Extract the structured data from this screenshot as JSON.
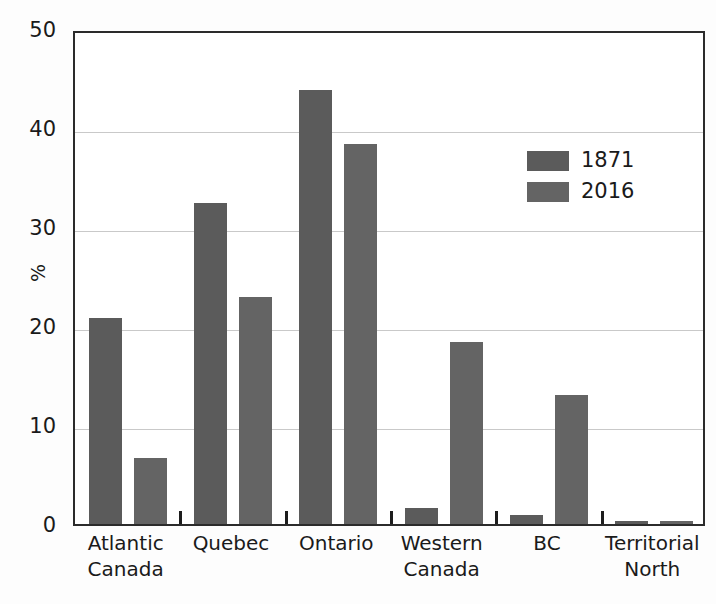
{
  "chart_data": {
    "type": "bar",
    "title": "",
    "subtitle": "",
    "xlabel": "",
    "ylabel": "%",
    "ylim": [
      0,
      50
    ],
    "yticks": [
      0,
      10,
      20,
      30,
      40,
      50
    ],
    "ytick_labels": [
      "0",
      "10",
      "20",
      "30",
      "40",
      "50"
    ],
    "grid": "horizontal",
    "legend_position": "top-right-inside",
    "categories": [
      "Atlantic Canada",
      "Quebec",
      "Ontario",
      "Western Canada",
      "BC",
      "Territorial North"
    ],
    "category_lines": [
      [
        "Atlantic",
        "Canada"
      ],
      [
        "Quebec",
        ""
      ],
      [
        "Ontario",
        ""
      ],
      [
        "Western",
        "Canada"
      ],
      [
        "BC",
        ""
      ],
      [
        "Territorial",
        "North"
      ]
    ],
    "series": [
      {
        "name": "1871",
        "color": "#5b5b5b",
        "values": [
          20.8,
          32.4,
          43.8,
          1.6,
          0.9,
          0.3
        ]
      },
      {
        "name": "2016",
        "color": "#646464",
        "values": [
          6.7,
          22.9,
          38.4,
          18.4,
          13.0,
          0.3
        ]
      }
    ]
  },
  "axis": {
    "y_title": "%"
  },
  "legend": {
    "entries": [
      {
        "label": "1871",
        "color": "#5b5b5b"
      },
      {
        "label": "2016",
        "color": "#646464"
      }
    ]
  },
  "colors": {
    "series_1871": "#5b5b5b",
    "series_2016": "#646464",
    "gridline": "#c9c9c9",
    "axis_border": "#2b2b2b",
    "text": "#1a1a1a",
    "background": "#fdfdfd"
  }
}
